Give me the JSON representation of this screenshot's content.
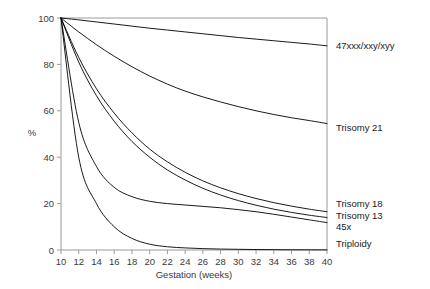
{
  "chart_data": {
    "type": "line",
    "title": "",
    "xlabel": "Gestation (weeks)",
    "ylabel": "%",
    "xlim": [
      10,
      40
    ],
    "ylim": [
      0,
      100
    ],
    "xticks": [
      10,
      12,
      14,
      16,
      18,
      20,
      22,
      24,
      26,
      28,
      30,
      32,
      34,
      36,
      38,
      40
    ],
    "yticks": [
      0,
      20,
      40,
      60,
      80,
      100
    ],
    "grid": false,
    "legend_position": "right-inline",
    "x": [
      10,
      12,
      14,
      16,
      18,
      20,
      22,
      24,
      26,
      28,
      30,
      32,
      34,
      36,
      38,
      40
    ],
    "series": [
      {
        "name": "47xxx/xxy/xyy",
        "label": "47xxx/xxy/xyy",
        "color": "#000000",
        "label_y_pct": 88,
        "values": [
          100,
          99.2,
          98.3,
          97.4,
          96.5,
          95.6,
          94.8,
          94.0,
          93.2,
          92.4,
          91.6,
          90.9,
          90.2,
          89.5,
          88.8,
          88.0
        ]
      },
      {
        "name": "Trisomy 21",
        "label": "Trisomy 21",
        "color": "#000000",
        "label_y_pct": 53,
        "values": [
          100,
          94.0,
          88.5,
          83.5,
          79.0,
          75.0,
          71.5,
          68.5,
          66.0,
          63.8,
          61.8,
          60.0,
          58.4,
          57.0,
          55.8,
          54.5
        ]
      },
      {
        "name": "Trisomy 18",
        "label": "Trisomy 18",
        "color": "#000000",
        "label_y_pct": 20,
        "values": [
          100,
          83.0,
          69.5,
          59.0,
          50.5,
          43.5,
          38.0,
          33.5,
          29.8,
          26.8,
          24.3,
          22.2,
          20.4,
          18.9,
          17.6,
          16.5
        ]
      },
      {
        "name": "Trisomy 13",
        "label": "Trisomy 13",
        "color": "#000000",
        "label_y_pct": 15,
        "values": [
          100,
          81.0,
          66.5,
          55.5,
          46.8,
          40.0,
          34.5,
          30.2,
          26.6,
          23.7,
          21.3,
          19.3,
          17.6,
          16.2,
          15.0,
          14.0
        ]
      },
      {
        "name": "45x",
        "label": "45x",
        "color": "#000000",
        "label_y_pct": 10,
        "values": [
          100,
          55.0,
          36.0,
          27.0,
          23.0,
          21.0,
          20.0,
          19.4,
          18.8,
          18.2,
          17.4,
          16.5,
          15.4,
          14.2,
          13.0,
          11.8
        ]
      },
      {
        "name": "Triploidy",
        "label": "Triploidy",
        "color": "#000000",
        "label_y_pct": 3,
        "values": [
          100,
          40.0,
          20.0,
          10.0,
          5.0,
          2.5,
          1.4,
          0.9,
          0.6,
          0.4,
          0.3,
          0.2,
          0.15,
          0.1,
          0.08,
          0.05
        ]
      }
    ]
  },
  "axes": {
    "x_title": "Gestation (weeks)",
    "y_title": "%",
    "x_tick_labels": [
      "10",
      "12",
      "14",
      "16",
      "18",
      "20",
      "22",
      "24",
      "26",
      "28",
      "30",
      "32",
      "34",
      "36",
      "38",
      "40"
    ],
    "y_tick_labels": [
      "0",
      "20",
      "40",
      "60",
      "80",
      "100"
    ]
  },
  "legend": {
    "entries": [
      "47xxx/xxy/xyy",
      "Trisomy 21",
      "Trisomy 18",
      "Trisomy 13",
      "45x",
      "Triploidy"
    ]
  }
}
